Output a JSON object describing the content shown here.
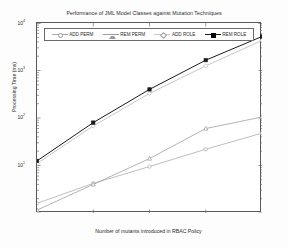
{
  "chart_data": {
    "type": "line",
    "title": "Performance of JML Model Classes against Mutation Techniques",
    "xlabel": "Number of mutants introduced in RBAC Policy",
    "ylabel": "Processing Time (ms)",
    "yscale": "log",
    "ylim": [
      1,
      10000
    ],
    "ytick_labels": [
      "10",
      "10",
      "10",
      "10"
    ],
    "ytick_exponents": [
      "4",
      "3",
      "2",
      "1"
    ],
    "ytick_values": [
      10000,
      1000,
      100,
      10
    ],
    "grid": false,
    "legend_position": "top-inside",
    "x": [
      10,
      20,
      30,
      40,
      50
    ],
    "xtick_labels": [
      "",
      "",
      "",
      "",
      ""
    ],
    "series": [
      {
        "name": "ADD PERM",
        "color": "#a8a8a8",
        "marker": "circle-open",
        "values": [
          1.6,
          4.2,
          9.5,
          22,
          48
        ]
      },
      {
        "name": "REM PERM",
        "color": "#9a9a9a",
        "marker": "triangle",
        "values": [
          1.15,
          4.0,
          14,
          60,
          105
        ]
      },
      {
        "name": "ADD ROLE",
        "color": "#b4b4b4",
        "marker": "diamond-open",
        "values": [
          11,
          68,
          330,
          1250,
          4300
        ]
      },
      {
        "name": "REM ROLE",
        "color": "#1a1a1a",
        "marker": "square-filled",
        "values": [
          12.5,
          80,
          400,
          1650,
          5200
        ]
      }
    ]
  },
  "legend": {
    "entries": [
      {
        "label": "ADD PERM"
      },
      {
        "label": "REM PERM"
      },
      {
        "label": "ADD ROLE"
      },
      {
        "label": "REM ROLE"
      }
    ]
  }
}
